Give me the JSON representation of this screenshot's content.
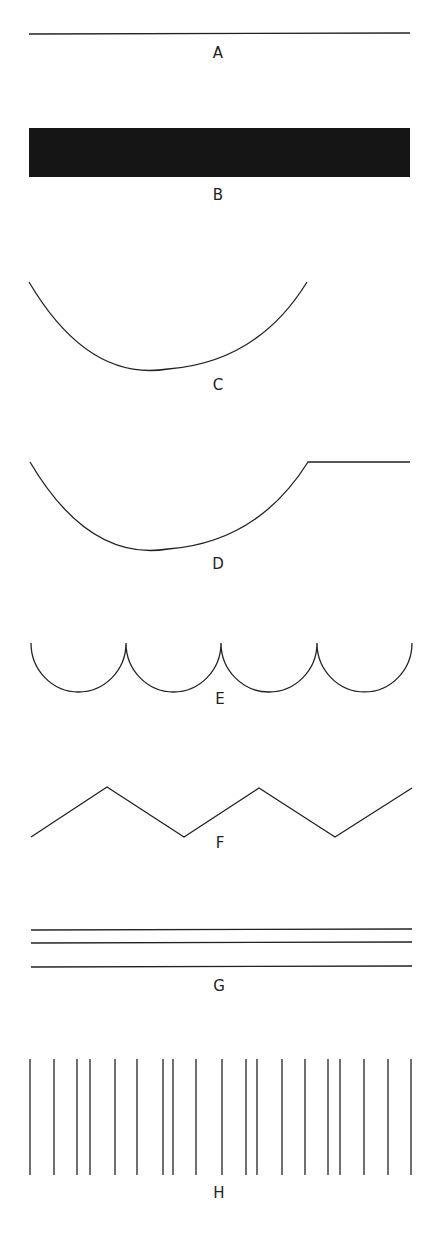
{
  "figure": {
    "panels": [
      {
        "id": "A",
        "label": "A",
        "shape": "single horizontal line"
      },
      {
        "id": "B",
        "label": "B",
        "shape": "solid black filled bar"
      },
      {
        "id": "C",
        "label": "C",
        "shape": "single concave arc"
      },
      {
        "id": "D",
        "label": "D",
        "shape": "concave arc followed by flat line"
      },
      {
        "id": "E",
        "label": "E",
        "shape": "four connected semicircular scallops"
      },
      {
        "id": "F",
        "label": "F",
        "shape": "zigzag line"
      },
      {
        "id": "G",
        "label": "G",
        "shape": "three parallel horizontal lines"
      },
      {
        "id": "H",
        "label": "H",
        "shape": "irregularly spaced vertical lines"
      }
    ],
    "colors": {
      "ink": "#222222",
      "background": "#ffffff",
      "fill": "#111111"
    }
  }
}
